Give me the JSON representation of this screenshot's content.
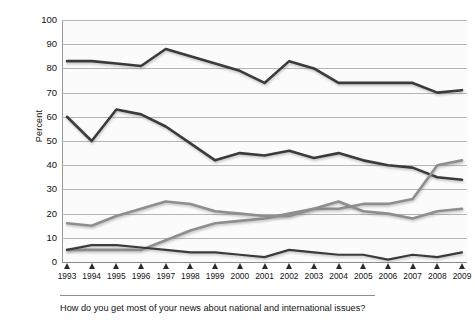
{
  "chart_data": {
    "type": "line",
    "title": "",
    "subtitle": "",
    "xlabel": "",
    "ylabel": "Percent",
    "ylim": [
      0,
      100
    ],
    "ytick_step": 10,
    "yticks": [
      100,
      90,
      80,
      70,
      60,
      50,
      40,
      30,
      20,
      10,
      0
    ],
    "grid": true,
    "legend_position": "none",
    "categories": [
      "1993",
      "1994",
      "1995",
      "1996",
      "1997",
      "1998",
      "1999",
      "2000",
      "2001",
      "2002",
      "2003",
      "2004",
      "2005",
      "2006",
      "2007",
      "2008",
      "2009"
    ],
    "series": [
      {
        "name": "Television",
        "color": "#3a3a3a",
        "width": 2.6,
        "values": [
          83,
          83,
          82,
          81,
          88,
          85,
          82,
          79,
          74,
          83,
          80,
          74,
          74,
          74,
          74,
          70,
          71
        ]
      },
      {
        "name": "Newspapers",
        "color": "#3a3a3a",
        "width": 2.6,
        "values": [
          60,
          50,
          63,
          61,
          56,
          49,
          42,
          45,
          44,
          46,
          43,
          45,
          42,
          40,
          39,
          35,
          34
        ]
      },
      {
        "name": "Internet",
        "color": "#8e8e8e",
        "width": 2.6,
        "values": [
          5,
          5,
          5,
          5,
          9,
          13,
          16,
          17,
          18,
          20,
          22,
          22,
          24,
          24,
          26,
          40,
          42
        ]
      },
      {
        "name": "Radio",
        "color": "#8e8e8e",
        "width": 2.6,
        "values": [
          16,
          15,
          19,
          22,
          25,
          24,
          21,
          20,
          19,
          19,
          22,
          25,
          21,
          20,
          18,
          21,
          22
        ]
      },
      {
        "name": "Magazines",
        "color": "#3a3a3a",
        "width": 2.2,
        "values": [
          5,
          7,
          7,
          6,
          5,
          4,
          4,
          3,
          2,
          5,
          4,
          3,
          3,
          1,
          3,
          2,
          4
        ]
      }
    ],
    "caption": "How do you get most of your news about national and international issues?"
  },
  "axis": {
    "y_title": "Percent"
  }
}
